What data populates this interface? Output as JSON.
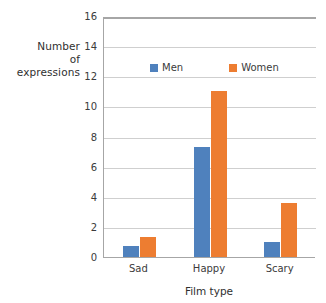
{
  "chart_data": {
    "type": "bar",
    "title": "",
    "xlabel": "Film type",
    "ylabel": "Number of expressions",
    "ylabel_lines": [
      "Number",
      "of",
      "expressions"
    ],
    "categories": [
      "Sad",
      "Happy",
      "Scary"
    ],
    "series": [
      {
        "name": "Men",
        "color": "#4f81bd",
        "values": [
          0.75,
          7.3,
          1.0
        ]
      },
      {
        "name": "Women",
        "color": "#ed7d31",
        "values": [
          1.35,
          11.0,
          3.6
        ]
      }
    ],
    "ylim": [
      0,
      16
    ],
    "yticks": [
      0,
      2,
      4,
      6,
      8,
      10,
      12,
      14,
      16
    ],
    "ytick_labels": [
      "0",
      "2",
      "4",
      "6",
      "8",
      "10",
      "12",
      "14",
      "16"
    ],
    "grid": true,
    "grid_axis": "y",
    "legend_position": "inside-top-center",
    "background": "#ffffff",
    "axis_color": "#a6a6a6",
    "grid_color": "#cfcfcf"
  }
}
